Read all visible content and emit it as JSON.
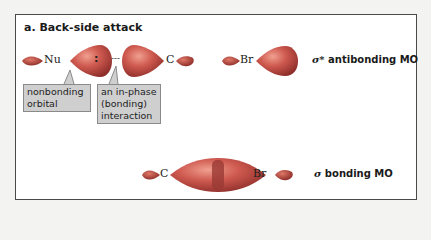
{
  "figure": {
    "title": "a. Back-side attack",
    "top_row": {
      "atoms": [
        "Nu",
        "C",
        "Br"
      ],
      "electron_pair": ":",
      "bond_dashes": "---",
      "label_symbol": "σ*",
      "label_text": "antibonding MO"
    },
    "callouts": [
      {
        "text": "nonbonding\norbital"
      },
      {
        "text": "an in-phase\n(bonding)\ninteraction"
      }
    ],
    "bottom_row": {
      "atoms": [
        "C",
        "Br"
      ],
      "label_symbol": "σ",
      "label_text": "bonding MO"
    },
    "colors": {
      "lobe_red": "#c8504a",
      "lobe_highlight": "#e88a7e",
      "lobe_dark": "#8e2e2a",
      "callout_bg": "#cfcfcf",
      "frame_border": "#4a4a4a"
    }
  }
}
